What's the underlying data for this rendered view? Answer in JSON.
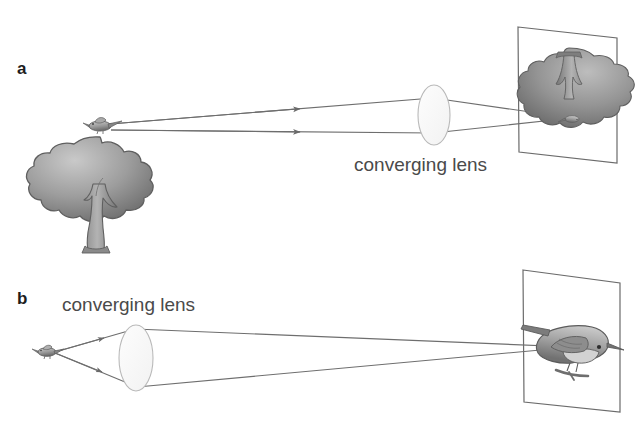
{
  "figure": {
    "background_color": "#ffffff",
    "ink_color": "#5a5a5a",
    "text_color": "#4a4a4a",
    "label_color": "#1d1d1d",
    "width": 635,
    "height": 433
  },
  "panels": [
    {
      "letter": "a",
      "caption": "converging lens",
      "object": "tree-with-bird",
      "image": "inverted-tree-on-screen",
      "ray_count": 2,
      "ray_direction": "left-to-right"
    },
    {
      "letter": "b",
      "caption": "converging lens",
      "object": "bird",
      "image": "inverted-bird-on-screen",
      "ray_count": 2,
      "ray_direction": "left-to-right"
    }
  ],
  "elements": {
    "panel_a_letter": "a",
    "panel_b_letter": "b",
    "panel_a_caption": "converging lens",
    "panel_b_caption": "converging lens"
  }
}
